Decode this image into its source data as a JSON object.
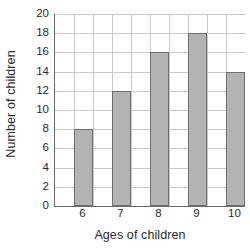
{
  "chart_data": {
    "type": "bar",
    "title": "",
    "xlabel": "Ages of children",
    "ylabel": "Number of children",
    "categories": [
      "6",
      "7",
      "8",
      "9",
      "10"
    ],
    "values": [
      8,
      12,
      16,
      18,
      14
    ],
    "ylim": [
      0,
      20
    ],
    "ytick_step": 2,
    "yticks": [
      "20",
      "18",
      "16",
      "14",
      "12",
      "10",
      "8",
      "6",
      "4",
      "2",
      "0"
    ],
    "ytick_values": [
      20,
      18,
      16,
      14,
      12,
      10,
      8,
      6,
      4,
      2,
      0
    ],
    "grid": true,
    "legend": false,
    "series": [
      {
        "name": "Number of children",
        "values": [
          8,
          12,
          16,
          18,
          14
        ]
      }
    ]
  },
  "style": {
    "bar_fill": "#b3b3b3",
    "bar_border": "#6e6e6e",
    "gridline": "#c9c9c9",
    "axis_line": "#6a6a6a",
    "background": "#ffffff",
    "text": "#2b2b2b"
  }
}
